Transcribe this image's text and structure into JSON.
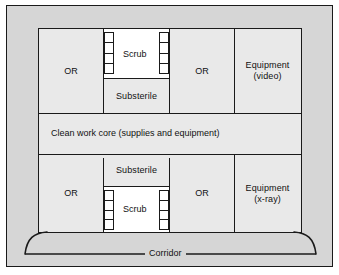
{
  "diagram": {
    "colors": {
      "outer_background": "#d6d6d6",
      "room_fill": "#e9e9e9",
      "scrub_fill": "#ffffff",
      "wall": "#1a1a1a",
      "page_background": "#ffffff"
    },
    "rooms": {
      "or_top_left": "OR",
      "or_top_right": "OR",
      "or_bottom_left": "OR",
      "or_bottom_right": "OR",
      "scrub_top": "Scrub",
      "scrub_bottom": "Scrub",
      "substerile_top": "Substerile",
      "substerile_bottom": "Substerile",
      "equipment_top_line1": "Equipment",
      "equipment_top_line2": "(video)",
      "equipment_bottom_line1": "Equipment",
      "equipment_bottom_line2": "(x-ray)",
      "clean_core": "Clean work core (supplies and equipment)",
      "corridor": "Corridor"
    },
    "fixtures": {
      "sink_label": "scrub-sink-bank",
      "sink_cell_count": 4
    }
  }
}
